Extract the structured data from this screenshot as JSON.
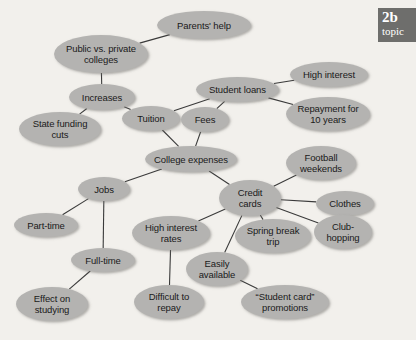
{
  "badge": {
    "number": "2b",
    "word": "topic"
  },
  "map": {
    "title": "College expenses concept map",
    "node_fill": "#b4b3b1",
    "background": "#f2f0ec",
    "edge_color": "#3a3a3a",
    "nodes": [
      {
        "id": "parents-help",
        "label": "Parents' help",
        "x": 157,
        "y": 11,
        "w": 94,
        "h": 28
      },
      {
        "id": "public-vs-private",
        "label": "Public vs. private\ncolleges",
        "x": 54,
        "y": 35,
        "w": 94,
        "h": 38
      },
      {
        "id": "increases",
        "label": "Increases",
        "x": 69,
        "y": 84,
        "w": 66,
        "h": 26
      },
      {
        "id": "state-funding-cuts",
        "label": "State funding\ncuts",
        "x": 19,
        "y": 112,
        "w": 82,
        "h": 34
      },
      {
        "id": "tuition",
        "label": "Tuition",
        "x": 122,
        "y": 106,
        "w": 58,
        "h": 25
      },
      {
        "id": "fees",
        "label": "Fees",
        "x": 181,
        "y": 107,
        "w": 48,
        "h": 25
      },
      {
        "id": "student-loans",
        "label": "Student loans",
        "x": 196,
        "y": 77,
        "w": 83,
        "h": 25
      },
      {
        "id": "high-interest",
        "label": "High interest",
        "x": 290,
        "y": 62,
        "w": 78,
        "h": 25
      },
      {
        "id": "repayment-10-years",
        "label": "Repayment for\n10 years",
        "x": 286,
        "y": 97,
        "w": 84,
        "h": 34
      },
      {
        "id": "college-expenses",
        "label": "College expenses",
        "x": 145,
        "y": 146,
        "w": 92,
        "h": 26
      },
      {
        "id": "football-weekends",
        "label": "Football\nweekends",
        "x": 286,
        "y": 146,
        "w": 70,
        "h": 34
      },
      {
        "id": "credit-cards",
        "label": "Credit\ncards",
        "x": 219,
        "y": 180,
        "w": 62,
        "h": 36
      },
      {
        "id": "clothes",
        "label": "Clothes",
        "x": 316,
        "y": 191,
        "w": 58,
        "h": 25
      },
      {
        "id": "club-hopping",
        "label": "Club-\nhopping",
        "x": 314,
        "y": 215,
        "w": 58,
        "h": 34
      },
      {
        "id": "jobs",
        "label": "Jobs",
        "x": 78,
        "y": 177,
        "w": 52,
        "h": 24
      },
      {
        "id": "part-time",
        "label": "Part-time",
        "x": 14,
        "y": 213,
        "w": 64,
        "h": 24
      },
      {
        "id": "full-time",
        "label": "Full-time",
        "x": 71,
        "y": 248,
        "w": 64,
        "h": 24
      },
      {
        "id": "effect-on-studying",
        "label": "Effect on\nstudying",
        "x": 16,
        "y": 287,
        "w": 72,
        "h": 34
      },
      {
        "id": "high-interest-rates",
        "label": "High interest\nrates",
        "x": 132,
        "y": 216,
        "w": 78,
        "h": 34
      },
      {
        "id": "difficult-to-repay",
        "label": "Difficult to\nrepay",
        "x": 134,
        "y": 285,
        "w": 70,
        "h": 34
      },
      {
        "id": "easily-available",
        "label": "Easily\navailable",
        "x": 186,
        "y": 252,
        "w": 62,
        "h": 34
      },
      {
        "id": "spring-break-trip",
        "label": "Spring break\ntrip",
        "x": 235,
        "y": 219,
        "w": 76,
        "h": 34
      },
      {
        "id": "student-card-promos",
        "label": "“Student card”\npromotions",
        "x": 241,
        "y": 285,
        "w": 88,
        "h": 34
      }
    ],
    "edges": [
      {
        "from": "public-vs-private",
        "to": "parents-help"
      },
      {
        "from": "public-vs-private",
        "to": "increases"
      },
      {
        "from": "increases",
        "to": "state-funding-cuts"
      },
      {
        "from": "increases",
        "to": "tuition"
      },
      {
        "from": "tuition",
        "to": "student-loans"
      },
      {
        "from": "fees",
        "to": "student-loans"
      },
      {
        "from": "student-loans",
        "to": "high-interest"
      },
      {
        "from": "student-loans",
        "to": "repayment-10-years"
      },
      {
        "from": "tuition",
        "to": "college-expenses"
      },
      {
        "from": "fees",
        "to": "college-expenses"
      },
      {
        "from": "college-expenses",
        "to": "jobs"
      },
      {
        "from": "college-expenses",
        "to": "credit-cards"
      },
      {
        "from": "credit-cards",
        "to": "football-weekends"
      },
      {
        "from": "credit-cards",
        "to": "clothes"
      },
      {
        "from": "credit-cards",
        "to": "club-hopping"
      },
      {
        "from": "credit-cards",
        "to": "spring-break-trip"
      },
      {
        "from": "credit-cards",
        "to": "high-interest-rates"
      },
      {
        "from": "credit-cards",
        "to": "easily-available"
      },
      {
        "from": "jobs",
        "to": "part-time"
      },
      {
        "from": "jobs",
        "to": "full-time"
      },
      {
        "from": "full-time",
        "to": "effect-on-studying"
      },
      {
        "from": "high-interest-rates",
        "to": "difficult-to-repay"
      },
      {
        "from": "easily-available",
        "to": "student-card-promos"
      }
    ]
  }
}
